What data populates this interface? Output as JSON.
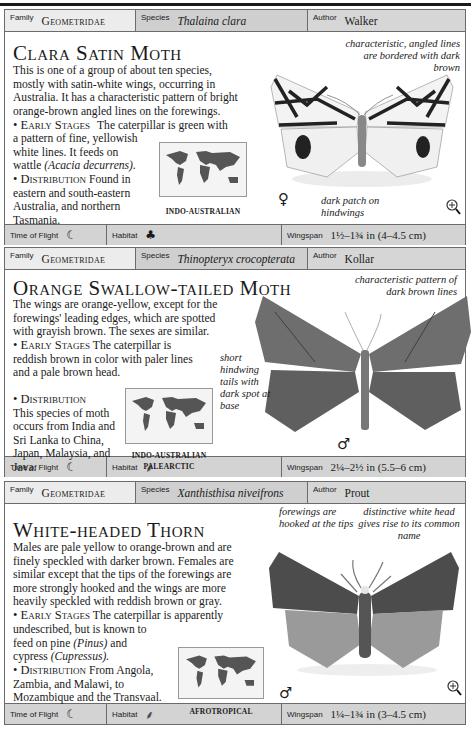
{
  "labels": {
    "family": "Family",
    "species": "Species",
    "author": "Author",
    "time_of_flight": "Time of Flight",
    "habitat": "Habitat",
    "wingspan": "Wingspan"
  },
  "icons": {
    "night_moon": "☾",
    "tree": "♣",
    "palm": "⸙",
    "female": "♀",
    "male": "♂"
  },
  "entries": [
    {
      "family": "Geometridae",
      "species": "Thalaina clara",
      "author": "Walker",
      "title": "Clara Satin Moth",
      "description": "This is one of a group of about ten species, mostly with satin-white wings, occurring in Australia. It has a characteristic pattern of bright orange-brown angled lines on the forewings.",
      "early_stages_label": "• Early Stages",
      "early_stages_text_1": "The caterpillar is green with a pattern of fine, yellowish white lines. It feeds on wattle",
      "early_stages_italic": "(Acacia decurrens).",
      "distribution_label": "• Distribution",
      "distribution_text": "Found in eastern and south-eastern Australia, and northern Tasmania.",
      "map_region": "INDO-AUSTRALIAN",
      "annotations": [
        "characteristic, angled lines are bordered with dark brown",
        "dark patch on hindwings"
      ],
      "sex_symbol": "♀",
      "time_of_flight": "night",
      "habitat": "tree",
      "wingspan": "1½–1¾ in (4–4.5 cm)"
    },
    {
      "family": "Geometridae",
      "species": "Thinopteryx crocopterata",
      "author": "Kollar",
      "title": "Orange Swallow-tailed Moth",
      "description": "The wings are orange-yellow, except for the forewings' leading edges, which are spotted with grayish brown. The sexes are similar.",
      "early_stages_label": "• Early Stages",
      "early_stages_text_1": "The caterpillar is reddish brown in color with paler lines and a pale brown head.",
      "distribution_label": "• Distribution",
      "distribution_text": "This species of moth occurs from India and Sri Lanka to China, Japan, Malaysia, and Java.",
      "map_region": "INDO-AUSTRALIAN PALEARCTIC",
      "map_region_line1": "INDO-AUSTRALIAN",
      "map_region_line2": "PALEARCTIC",
      "annotations": [
        "characteristic pattern of dark brown lines",
        "short hindwing tails with dark spot at base"
      ],
      "sex_symbol": "♂",
      "time_of_flight": "night",
      "habitat": "palm",
      "wingspan": "2¼–2½ in (5.5–6 cm)"
    },
    {
      "family": "Geometridae",
      "species": "Xanthisthisa niveifrons",
      "author": "Prout",
      "title": "White-headed Thorn",
      "description": "Males are pale yellow to orange-brown and are finely speckled with darker brown. Females are similar except that the tips of the forewings are more strongly hooked and the wings are more heavily speckled with reddish brown or gray.",
      "early_stages_label": "• Early Stages",
      "early_stages_text_1": "The caterpillar is apparently undescribed, but is known to feed on pine",
      "early_stages_italic": "(Pinus)",
      "early_stages_text_2": "and cypress",
      "early_stages_italic_2": "(Cupressus).",
      "distribution_label": "• Distribution",
      "distribution_text": "From Angola, Zambia, and Malawi, to Mozambique and the Transvaal.",
      "map_region": "AFROTROPICAL",
      "annotations": [
        "forewings are hooked at the tips",
        "distinctive white head gives rise to its common name"
      ],
      "sex_symbol": "♂",
      "time_of_flight": "night",
      "habitat": "palm",
      "wingspan": "1¼–1¾ in (3–4.5 cm)"
    }
  ]
}
